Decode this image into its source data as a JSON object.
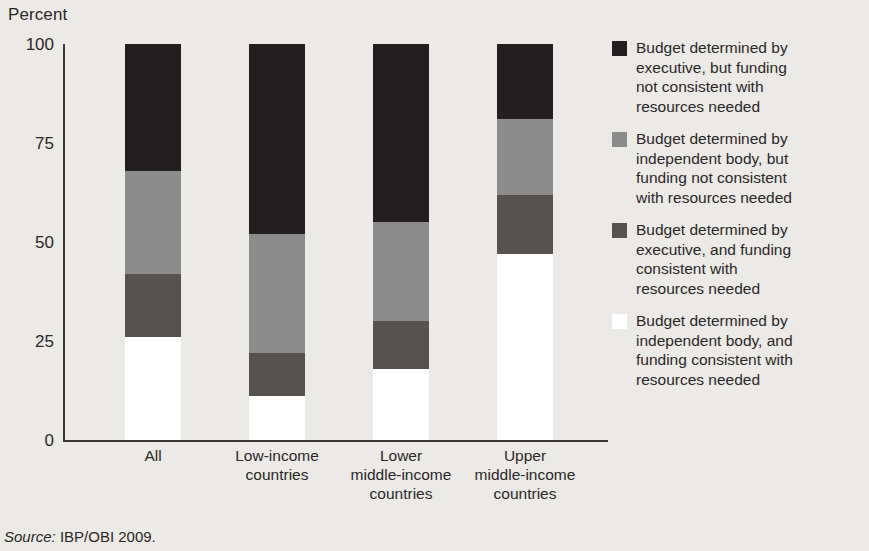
{
  "chart_data": {
    "type": "bar",
    "subtype": "stacked-bar-100",
    "title": "",
    "xlabel": "",
    "ylabel": "Percent",
    "ylim": [
      0,
      100
    ],
    "yticks": [
      "0",
      "25",
      "50",
      "75",
      "100"
    ],
    "grid": false,
    "legend_position": "right",
    "categories": [
      "All",
      "Low-income countries",
      "Lower middle-income countries",
      "Upper middle-income countries"
    ],
    "category_labels": [
      [
        "All"
      ],
      [
        "Low-income",
        "countries"
      ],
      [
        "Lower",
        "middle-income",
        "countries"
      ],
      [
        "Upper",
        "middle-income",
        "countries"
      ]
    ],
    "series": [
      {
        "name": "Budget determined by executive, but funding not consistent with resources needed",
        "color": "#231f20",
        "values": [
          32,
          48,
          45,
          19
        ]
      },
      {
        "name": "Budget determined by independent body, but funding not consistent with resources needed",
        "color": "#8d8c8c",
        "values": [
          26,
          30,
          25,
          19
        ]
      },
      {
        "name": "Budget determined by executive, and funding consistent with resources needed",
        "color": "#56524f",
        "values": [
          16,
          11,
          12,
          15
        ]
      },
      {
        "name": "Budget determined by independent body, and funding consistent with resources needed",
        "color": "#ffffff",
        "values": [
          26,
          11,
          18,
          47
        ]
      }
    ]
  },
  "legend": {
    "items": [
      {
        "swatch": "black",
        "lines": [
          "Budget determined by",
          "executive, but funding",
          "not consistent with",
          "resources needed"
        ]
      },
      {
        "swatch": "lgray",
        "lines": [
          "Budget determined by",
          "independent body, but",
          "funding not consistent",
          "with resources needed"
        ]
      },
      {
        "swatch": "dgray",
        "lines": [
          "Budget determined by",
          "executive, and funding",
          "consistent with",
          "resources needed"
        ]
      },
      {
        "swatch": "white",
        "lines": [
          "Budget determined by",
          "independent body, and",
          "funding consistent with",
          "resources needed"
        ]
      }
    ]
  },
  "source": {
    "label": "Source:",
    "text": "IBP/OBI 2009."
  },
  "colors": {
    "background": "#eceae7",
    "axis": "#3a3536",
    "text": "#2b2725",
    "black": "#231f20",
    "light_gray": "#8d8c8c",
    "dark_gray": "#56524f",
    "white": "#ffffff"
  }
}
